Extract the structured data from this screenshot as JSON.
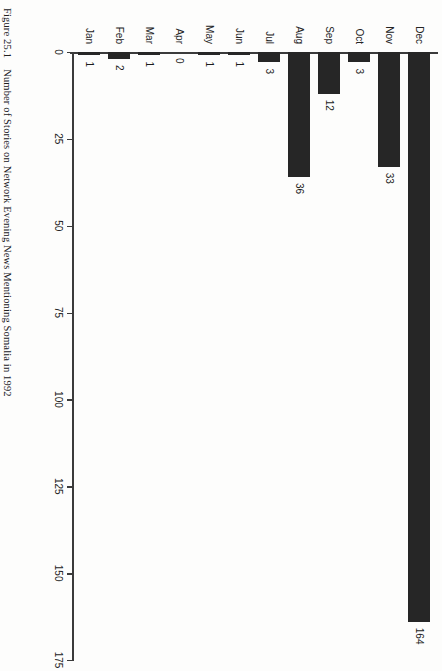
{
  "figure": {
    "number": "Figure 25.1",
    "caption": "Number of Stories on Network Evening News Mentioning Somalia in 1992",
    "full_caption": "Figure 25.1  Number of Stories on Network Evening News Mentioning Somalia in 1992"
  },
  "chart_data": {
    "type": "bar",
    "orientation": "horizontal",
    "title": "Number of Stories on Network Evening News Mentioning Somalia in 1992",
    "xlabel": "",
    "ylabel": "",
    "categories": [
      "Jan",
      "Feb",
      "Mar",
      "Apr",
      "May",
      "Jun",
      "Jul",
      "Aug",
      "Sep",
      "Oct",
      "Nov",
      "Dec"
    ],
    "values": [
      1,
      2,
      1,
      0,
      1,
      1,
      3,
      36,
      12,
      3,
      33,
      164
    ],
    "value_labels": [
      "1",
      "2",
      "1",
      "0",
      "1",
      "1",
      "3",
      "36",
      "12",
      "3",
      "33",
      "164"
    ],
    "axis_ticks": [
      0,
      25,
      50,
      75,
      100,
      125,
      150,
      175
    ],
    "axis_tick_labels": [
      "0",
      "25",
      "50",
      "75",
      "100",
      "125",
      "150",
      "175"
    ],
    "ylim": [
      0,
      175
    ],
    "grid": false,
    "legend": null,
    "bar_color": "#262626",
    "axis_color": "#3b3b3b",
    "background": "#fdfdfc",
    "rotation_degrees": 90,
    "note": "Chart is printed sideways on the scanned book page; category axis reads Jan at bottom to Dec at top."
  }
}
